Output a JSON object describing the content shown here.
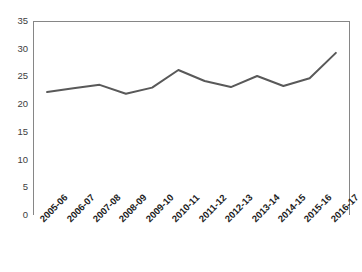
{
  "chart_data": {
    "type": "line",
    "title": "",
    "subtitle": "",
    "xlabel": "",
    "ylabel": "",
    "categories": [
      "2005-06",
      "2006-07",
      "2007-08",
      "2008-09",
      "2009-10",
      "2010-11",
      "2011-12",
      "2012-13",
      "2013-14",
      "2014-15",
      "2015-16",
      "2016-17"
    ],
    "values": [
      22.3,
      23.0,
      23.6,
      22.0,
      23.1,
      26.3,
      24.3,
      23.2,
      25.2,
      23.4,
      24.8,
      29.4
    ],
    "series": [
      {
        "name": "",
        "values": [
          22.3,
          23.0,
          23.6,
          22.0,
          23.1,
          26.3,
          24.3,
          23.2,
          25.2,
          23.4,
          24.8,
          29.4
        ]
      }
    ],
    "ylim": [
      0,
      35
    ],
    "y_ticks": [
      0,
      5,
      10,
      15,
      20,
      25,
      30,
      35
    ],
    "y_tick_labels": [
      "0",
      "5",
      "10",
      "15",
      "20",
      "25",
      "30",
      "35"
    ],
    "grid": false,
    "legend": false,
    "legend_position": "none",
    "line_color": "#595959",
    "line_width": 2,
    "markers": false,
    "axis_color": "#868686",
    "plot_background": "#ffffff"
  },
  "caption": {
    "text": ""
  }
}
